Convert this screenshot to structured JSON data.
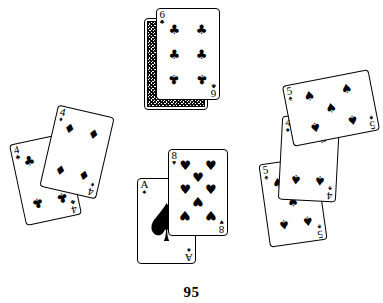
{
  "page": {
    "number": "95",
    "background_color": "#ffffff",
    "ink_color": "#000000",
    "width": 383,
    "height": 303
  },
  "suit_glyphs": {
    "spades": "♠",
    "hearts": "♥",
    "clubs": "♣",
    "diamonds": "♦"
  },
  "groups": [
    {
      "name": "top-center-pair",
      "cards": [
        "back-card",
        "six-of-clubs"
      ]
    },
    {
      "name": "left-pair",
      "cards": [
        "four-of-clubs",
        "four-of-diamonds"
      ]
    },
    {
      "name": "center-pair",
      "cards": [
        "ace-of-spades",
        "eight-of-hearts"
      ]
    },
    {
      "name": "right-trio",
      "cards": [
        "five-of-spades-lower",
        "four-of-spades",
        "five-of-spades-upper"
      ]
    }
  ],
  "cards": [
    {
      "id": "back-card",
      "label": "face-down-card",
      "rank": "",
      "suit": "",
      "suit_glyph": "",
      "face_up": false,
      "x": 144,
      "y": 18,
      "w": 64,
      "h": 92,
      "rot": 0,
      "z": 1
    },
    {
      "id": "six-of-clubs",
      "label": "six-of-clubs",
      "rank": "6",
      "suit": "clubs",
      "suit_glyph": "♣",
      "face_up": true,
      "pip_count": 6,
      "x": 156,
      "y": 8,
      "w": 64,
      "h": 92,
      "rot": 0,
      "z": 2
    },
    {
      "id": "four-of-clubs",
      "label": "four-of-clubs",
      "rank": "4",
      "suit": "clubs",
      "suit_glyph": "♣",
      "face_up": true,
      "pip_count": 4,
      "x": 17,
      "y": 138,
      "w": 57,
      "h": 83,
      "rot": -12,
      "z": 1
    },
    {
      "id": "four-of-diamonds",
      "label": "four-of-diamonds",
      "rank": "4",
      "suit": "diamonds",
      "suit_glyph": "♦",
      "face_up": true,
      "pip_count": 4,
      "x": 48,
      "y": 110,
      "w": 58,
      "h": 84,
      "rot": 13,
      "z": 2
    },
    {
      "id": "ace-of-spades",
      "label": "ace-of-spades",
      "rank": "A",
      "suit": "spades",
      "suit_glyph": "♠",
      "face_up": true,
      "pip_count": 1,
      "x": 137,
      "y": 178,
      "w": 59,
      "h": 86,
      "rot": 0,
      "z": 1
    },
    {
      "id": "eight-of-hearts",
      "label": "eight-of-hearts",
      "rank": "8",
      "suit": "hearts",
      "suit_glyph": "♥",
      "face_up": true,
      "pip_count": 8,
      "x": 168,
      "y": 149,
      "w": 60,
      "h": 87,
      "rot": 0,
      "z": 2
    },
    {
      "id": "five-of-spades-lower",
      "label": "five-of-spades-lower",
      "rank": "5",
      "suit": "spades",
      "suit_glyph": "♠",
      "face_up": true,
      "pip_count": 5,
      "x": 264,
      "y": 160,
      "w": 58,
      "h": 84,
      "rot": -8,
      "z": 1
    },
    {
      "id": "four-of-spades",
      "label": "four-of-spades",
      "rank": "4",
      "suit": "spades",
      "suit_glyph": "♠",
      "face_up": true,
      "pip_count": 4,
      "x": 280,
      "y": 117,
      "w": 58,
      "h": 84,
      "rot": 3,
      "z": 2
    },
    {
      "id": "five-of-spades-upper",
      "label": "five-of-spades-upper",
      "rank": "5",
      "suit": "spades",
      "suit_glyph": "♠",
      "face_up": true,
      "pip_count": 5,
      "x": 287,
      "y": 77,
      "w": 88,
      "h": 62,
      "rot": -11,
      "z": 3
    }
  ]
}
